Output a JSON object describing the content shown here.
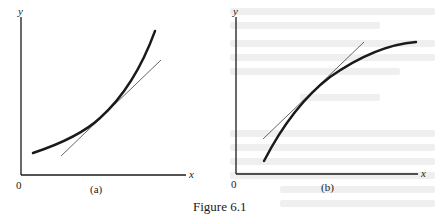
{
  "figure": {
    "caption": "Figure 6.1",
    "panels": [
      {
        "id": "a",
        "label": "(a)",
        "y_axis_label": "y",
        "x_axis_label": "x",
        "origin_label": "0",
        "description": "Convex increasing curve with tangent line lying below the curve"
      },
      {
        "id": "b",
        "label": "(b)",
        "y_axis_label": "y",
        "x_axis_label": "x",
        "origin_label": "0",
        "description": "Concave increasing curve with tangent line lying above the curve"
      }
    ]
  },
  "colors": {
    "ink": "#1a1a1a",
    "tangent": "#555555",
    "background": "#ffffff",
    "show_through": "#efefef"
  }
}
